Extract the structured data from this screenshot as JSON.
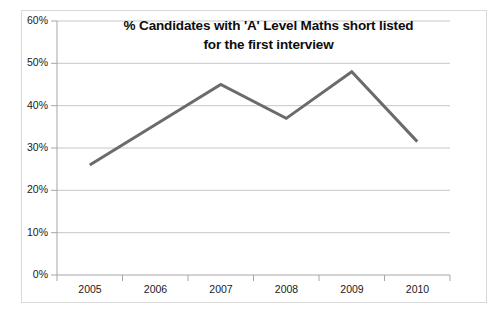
{
  "chart_data": {
    "type": "line",
    "title": "% Candidates with 'A' Level Maths short listed for the first interview",
    "title_lines": [
      "% Candidates with 'A' Level Maths short listed",
      "for the first interview"
    ],
    "categories": [
      "2005",
      "2006",
      "2007",
      "2008",
      "2009",
      "2010"
    ],
    "values": [
      26,
      35.5,
      45,
      37,
      48,
      31.5
    ],
    "series": [
      {
        "name": "% Candidates with 'A' Level Maths short listed for the first interview",
        "values": [
          26,
          35.5,
          45,
          37,
          48,
          31.5
        ],
        "color": "#6b6b6b"
      }
    ],
    "xlabel": "",
    "ylabel": "",
    "ylim": [
      0,
      60
    ],
    "ytick_values": [
      0,
      10,
      20,
      30,
      40,
      50,
      60
    ],
    "ytick_labels": [
      "0%",
      "10%",
      "20%",
      "30%",
      "40%",
      "50%",
      "60%"
    ],
    "xtick_labels": [
      "2005",
      "2006",
      "2007",
      "2008",
      "2009",
      "2010"
    ],
    "grid": "horizontal",
    "legend": "none",
    "markers": "none",
    "line_width": 3,
    "colors": {
      "line": "#6b6b6b",
      "gridline": "#c7c7c7",
      "axis": "#a6a6a6",
      "border": "#d9d9d9",
      "text": "#1a1a1a",
      "title": "#0d0d0d",
      "background": "#ffffff"
    }
  }
}
